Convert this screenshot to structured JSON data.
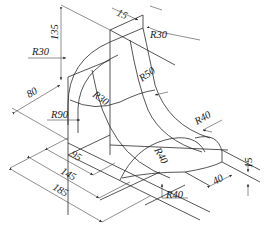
{
  "drawing": {
    "type": "isometric technical drawing",
    "dimensions": {
      "d135": "135",
      "d15_top": "15",
      "r30_top": "R30",
      "r30_left": "R30",
      "r30_inner": "R30",
      "r50": "R50",
      "d80": "80",
      "r90": "R90",
      "r40_right": "R40",
      "r40_center": "R40",
      "r40_bottom": "R40",
      "d95": "95",
      "d145": "145",
      "d185": "185",
      "d40": "40",
      "d15_right": "15"
    },
    "colors": {
      "line": "#2a2a2a",
      "background": "#ffffff"
    }
  }
}
